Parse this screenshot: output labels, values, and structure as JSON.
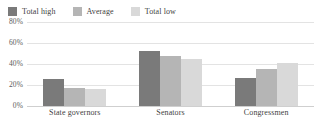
{
  "chart_data": {
    "type": "bar",
    "title": "",
    "subtitle": "",
    "xlabel": "",
    "ylabel": "",
    "categories": [
      "State governors",
      "Senators",
      "Congressmen"
    ],
    "series": [
      {
        "name": "Total high",
        "color": "#7a7a7a",
        "values": [
          26,
          52,
          27
        ]
      },
      {
        "name": "Average",
        "color": "#b5b5b5",
        "values": [
          17,
          48,
          35
        ]
      },
      {
        "name": "Total low",
        "color": "#d9d9d9",
        "values": [
          16,
          45,
          41
        ]
      }
    ],
    "grouped_values": {
      "State governors": {
        "Total high": 26,
        "Average": 52,
        "Total low": 27
      },
      "Senators": {
        "Total high": 17,
        "Average": 48,
        "Total low": 35
      },
      "Congressmen": {
        "Total high": 16,
        "Average": 45,
        "Total low": 41
      }
    },
    "ylim": [
      0,
      80
    ],
    "ytick_values": [
      0,
      20,
      40,
      60,
      80
    ],
    "ytick_labels": [
      "0%",
      "20%",
      "40%",
      "60%",
      "80%"
    ],
    "grid": true,
    "grid_axis": "y",
    "legend_position": "top-left",
    "value_unit": "%"
  },
  "legend": {
    "items": [
      {
        "label": "Total high",
        "color": "#7a7a7a"
      },
      {
        "label": "Average",
        "color": "#b5b5b5"
      },
      {
        "label": "Total low",
        "color": "#d9d9d9"
      }
    ]
  },
  "axes": {
    "y_ticks": [
      "80%",
      "60%",
      "40%",
      "20%",
      "0%"
    ],
    "x_labels": [
      "State governors",
      "Senators",
      "Congressmen"
    ]
  }
}
